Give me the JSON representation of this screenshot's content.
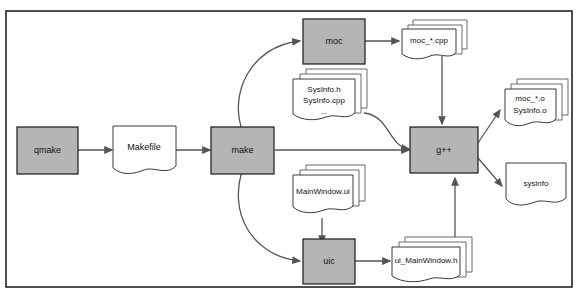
{
  "diagram": {
    "colors": {
      "process_fill": "#b5b5b5",
      "process_stroke": "#1a1a1a",
      "document_fill": "#ffffff",
      "document_stroke": "#3a3a3a",
      "edge": "#555555",
      "frame": "#222222",
      "background": "#ffffff"
    },
    "nodes": {
      "qmake": {
        "label": "qmake",
        "type": "process"
      },
      "makefile": {
        "label": "Makefile",
        "type": "document"
      },
      "make": {
        "label": "make",
        "type": "process"
      },
      "moc": {
        "label": "moc",
        "type": "process"
      },
      "uic": {
        "label": "uic",
        "type": "process"
      },
      "gpp": {
        "label": "g++",
        "type": "process"
      },
      "moc_cpp": {
        "label": "moc_*.cpp",
        "type": "document-stack"
      },
      "sysinfo_sources": {
        "line1": "SysInfo.h",
        "line2": "SysInfo.cpp",
        "line3": "...",
        "type": "document-stack"
      },
      "mainwindow_ui": {
        "label": "MainWindow.ui",
        "type": "document-stack"
      },
      "ui_mainwindow_h": {
        "label": "ui_MainWindow.h",
        "type": "document-stack"
      },
      "objects": {
        "line1": "moc_*.o",
        "line2": "SysInfo.o",
        "type": "document-stack"
      },
      "sysinfo_binary": {
        "label": "sysinfo",
        "type": "document"
      }
    },
    "edges": [
      {
        "from": "qmake",
        "to": "makefile"
      },
      {
        "from": "makefile",
        "to": "make"
      },
      {
        "from": "make",
        "to": "moc"
      },
      {
        "from": "make",
        "to": "uic"
      },
      {
        "from": "make",
        "to": "gpp"
      },
      {
        "from": "moc",
        "to": "moc_cpp"
      },
      {
        "from": "moc_cpp",
        "to": "gpp"
      },
      {
        "from": "sysinfo_sources",
        "to": "gpp"
      },
      {
        "from": "mainwindow_ui",
        "to": "uic"
      },
      {
        "from": "uic",
        "to": "ui_mainwindow_h"
      },
      {
        "from": "ui_mainwindow_h",
        "to": "gpp"
      },
      {
        "from": "gpp",
        "to": "objects"
      },
      {
        "from": "gpp",
        "to": "sysinfo_binary"
      }
    ]
  }
}
